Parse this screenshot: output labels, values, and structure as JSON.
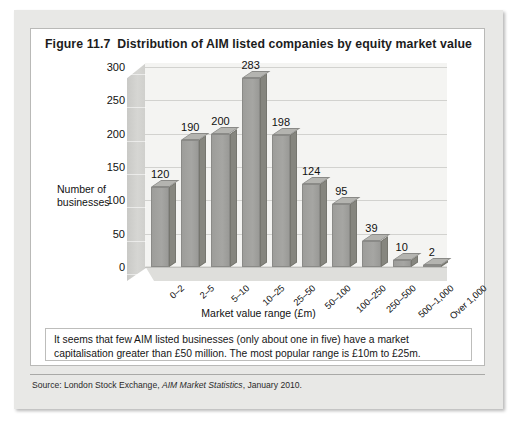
{
  "figure": {
    "number": "Figure 11.7",
    "title": "Distribution of AIM listed companies by equity market value"
  },
  "commentary": "It seems that few AIM listed businesses (only about one in five) have a market capitalisation greater than £50 million. The most popular range is £10m to £25m.",
  "source": {
    "prefix": "Source: London Stock Exchange,",
    "italic": "AIM Market Statistics",
    "suffix": ", January 2010."
  },
  "chart_data": {
    "type": "bar",
    "title": "Distribution of AIM listed companies by equity market value",
    "xlabel": "Market value range (£m)",
    "ylabel": "Number of businesses",
    "categories": [
      "0–2",
      "2–5",
      "5–10",
      "10–25",
      "25–50",
      "50–100",
      "100–250",
      "250–500",
      "500–1,000",
      "Over 1,000"
    ],
    "values": [
      120,
      190,
      200,
      283,
      198,
      124,
      95,
      39,
      10,
      2
    ],
    "ylim": [
      0,
      300
    ],
    "yticks": [
      0,
      50,
      100,
      150,
      200,
      250,
      300
    ],
    "ytick_labels": [
      "0",
      "50",
      "100",
      "150",
      "200",
      "250",
      "300"
    ],
    "grid": true,
    "legend": "none",
    "data_labels": true,
    "bar_color": "#a2a29f",
    "bar_side_color": "#86867f",
    "plot_background": "#f4f4f2",
    "three_d": true
  }
}
